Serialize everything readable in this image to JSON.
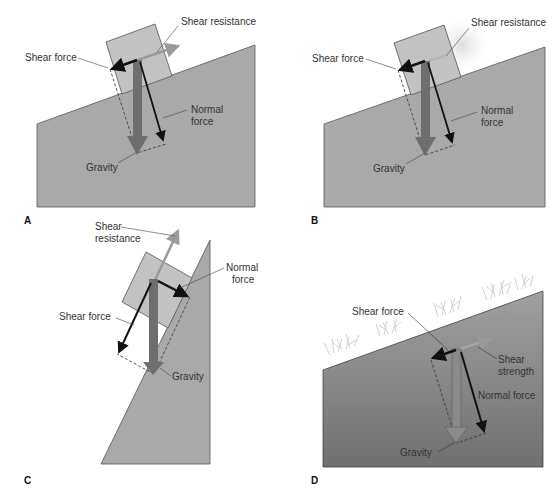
{
  "colors": {
    "ground": "#a9a9a9",
    "ground_stroke": "#555555",
    "block": "#c2c2c2",
    "gravity_arrow": "#6e6e6e",
    "normal_arrow": "#111111",
    "shear_force_arrow": "#111111",
    "shear_resistance_arrow": "#9a9a9a",
    "leader": "#444444",
    "grass": "#c8c8c8",
    "ground_d_top": "#9c9c9c",
    "ground_d_bottom": "#6f6f6f"
  },
  "panels": [
    {
      "letter": "A",
      "labels": {
        "shear_resistance": "Shear resistance",
        "shear_force": "Shear force",
        "normal_force_1": "Normal",
        "normal_force_2": "force",
        "gravity": "Gravity"
      }
    },
    {
      "letter": "B",
      "labels": {
        "shear_resistance": "Shear resistance",
        "shear_force": "Shear force",
        "normal_force_1": "Normal",
        "normal_force_2": "force",
        "gravity": "Gravity"
      }
    },
    {
      "letter": "C",
      "labels": {
        "shear_resistance_1": "Shear",
        "shear_resistance_2": "resistance",
        "shear_force": "Shear force",
        "normal_force_1": "Normal",
        "normal_force_2": "force",
        "gravity": "Gravity"
      }
    },
    {
      "letter": "D",
      "labels": {
        "shear_force": "Shear force",
        "shear_strength_1": "Shear",
        "shear_strength_2": "strength",
        "normal_force": "Normal force",
        "gravity": "Gravity"
      }
    }
  ]
}
